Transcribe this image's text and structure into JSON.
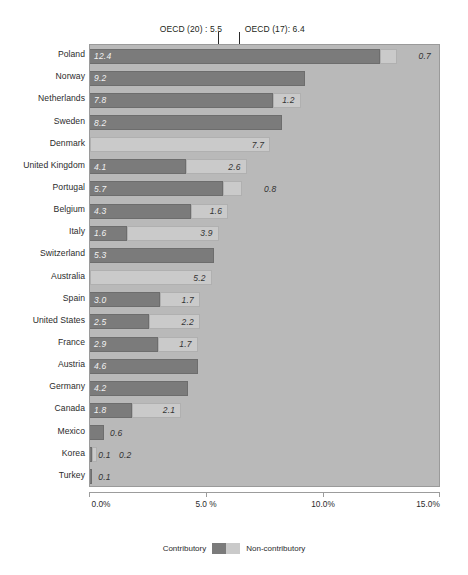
{
  "chart_data": {
    "type": "bar",
    "orientation": "horizontal",
    "stacked": true,
    "title": "",
    "xlabel": "%",
    "ylabel": "",
    "xlim": [
      0,
      15
    ],
    "grid": false,
    "legend_position": "bottom-center",
    "categories": [
      "Poland",
      "Norway",
      "Netherlands",
      "Sweden",
      "Denmark",
      "United Kingdom",
      "Portugal",
      "Belgium",
      "Italy",
      "Switzerland",
      "Australia",
      "Spain",
      "United States",
      "France",
      "Austria",
      "Germany",
      "Canada",
      "Mexico",
      "Korea",
      "Turkey"
    ],
    "series": [
      {
        "name": "Contributory",
        "color": "#7b7b7b",
        "values": [
          12.4,
          9.2,
          7.8,
          8.2,
          0.0,
          4.1,
          5.7,
          4.3,
          1.6,
          5.3,
          0.0,
          3.0,
          2.5,
          2.9,
          4.6,
          4.2,
          1.8,
          0.6,
          0.1,
          0.1
        ]
      },
      {
        "name": "Non-contributory",
        "color": "#cacaca",
        "values": [
          0.7,
          0.0,
          1.2,
          0.0,
          7.7,
          2.6,
          0.8,
          1.6,
          3.9,
          0.0,
          5.2,
          1.7,
          2.2,
          1.7,
          0.0,
          0.0,
          2.1,
          0.0,
          0.2,
          0.0
        ]
      }
    ],
    "value_labels": {
      "Poland": {
        "contributory": "12.4",
        "noncontributory": "0.7"
      },
      "Norway": {
        "contributory": "9.2",
        "noncontributory": ""
      },
      "Netherlands": {
        "contributory": "7.8",
        "noncontributory": "1.2"
      },
      "Sweden": {
        "contributory": "8.2",
        "noncontributory": ""
      },
      "Denmark": {
        "contributory": "",
        "noncontributory": "7.7"
      },
      "United Kingdom": {
        "contributory": "4.1",
        "noncontributory": "2.6"
      },
      "Portugal": {
        "contributory": "5.7",
        "noncontributory": "0.8"
      },
      "Belgium": {
        "contributory": "4.3",
        "noncontributory": "1.6"
      },
      "Italy": {
        "contributory": "1.6",
        "noncontributory": "3.9"
      },
      "Switzerland": {
        "contributory": "5.3",
        "noncontributory": ""
      },
      "Australia": {
        "contributory": "",
        "noncontributory": "5.2"
      },
      "Spain": {
        "contributory": "3.0",
        "noncontributory": "1.7"
      },
      "United States": {
        "contributory": "2.5",
        "noncontributory": "2.2"
      },
      "France": {
        "contributory": "2.9",
        "noncontributory": "1.7"
      },
      "Austria": {
        "contributory": "4.6",
        "noncontributory": ""
      },
      "Germany": {
        "contributory": "4.2",
        "noncontributory": ""
      },
      "Canada": {
        "contributory": "1.8",
        "noncontributory": "2.1"
      },
      "Mexico": {
        "contributory": "0.6",
        "noncontributory": ""
      },
      "Korea": {
        "contributory": "0.1",
        "noncontributory": "0.2"
      },
      "Turkey": {
        "contributory": "0.1",
        "noncontributory": ""
      }
    },
    "xticks": [
      0,
      5,
      10,
      15
    ],
    "xticklabels": [
      "0.0%",
      "5.0 %",
      "10.0%",
      "15.0%"
    ],
    "annotations": [
      {
        "label": "OECD (20) : 5.5",
        "value": 5.5
      },
      {
        "label": "OECD (17): 6.4",
        "value": 6.4
      }
    ],
    "legend": [
      {
        "label": "Contributory",
        "color": "#7b7b7b"
      },
      {
        "label": "Non-contributory",
        "color": "#cacaca"
      }
    ],
    "colors": {
      "contributory": "#7b7b7b",
      "noncontributory": "#cacaca",
      "plot_background": "#b9b9b9",
      "page_background": "#ffffff",
      "text": "#2b2b2b",
      "marker_line": "#2b2b2b"
    }
  }
}
